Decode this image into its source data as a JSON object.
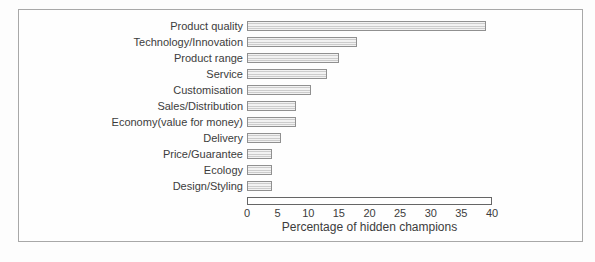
{
  "chart_data": {
    "type": "bar",
    "orientation": "horizontal",
    "title": "",
    "categories": [
      "Product quality",
      "Technology/Innovation",
      "Product range",
      "Service",
      "Customisation",
      "Sales/Distribution",
      "Economy(value for money)",
      "Delivery",
      "Price/Guarantee",
      "Ecology",
      "Design/Styling"
    ],
    "values": [
      39,
      18,
      15,
      13,
      10.5,
      8,
      8,
      5.5,
      4,
      4,
      4
    ],
    "xlabel": "Percentage of hidden champions",
    "xlim": [
      0,
      40
    ],
    "xticks": [
      0,
      5,
      10,
      15,
      20,
      25,
      30,
      35,
      40
    ],
    "grid": false,
    "legend": null
  },
  "styles": {
    "bar_fill_light": "#f2f2f2",
    "bar_fill_dark": "#cccccc",
    "bar_border": "#909090",
    "axis_box_border": "#666666",
    "frame_border": "#a8a8a8",
    "text_color": "#3c3c3c"
  }
}
